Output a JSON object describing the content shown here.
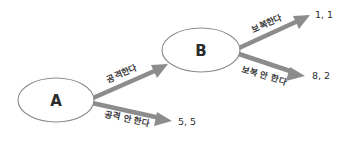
{
  "diagram": {
    "title": "",
    "background_color": "#ffffff",
    "line_color": "#8c8c8c",
    "node_stroke_color": "#8a8a8a",
    "text_color": "#2b2b2b",
    "nodes": [
      {
        "id": "A",
        "label": "A",
        "cx": 56,
        "cy": 100,
        "rx": 38,
        "ry": 22
      },
      {
        "id": "B",
        "label": "B",
        "cx": 201,
        "cy": 50,
        "rx": 39,
        "ry": 22
      }
    ],
    "edges": [
      {
        "id": "a-attack",
        "label": "공격한다",
        "from": "A",
        "to": "B",
        "x1": 93,
        "y1": 98,
        "x2": 166,
        "y2": 66,
        "label_x": 122,
        "label_y": 74,
        "label_rotate": -23
      },
      {
        "id": "a-no-attack",
        "label": "공격 안 한다",
        "from": "A",
        "to": "payoff-5-5",
        "x1": 92,
        "y1": 104,
        "x2": 170,
        "y2": 121,
        "label_x": 127,
        "label_y": 119,
        "label_rotate": 12
      },
      {
        "id": "b-retaliate",
        "label": "보복한다",
        "from": "B",
        "to": "payoff-1-1",
        "x1": 239,
        "y1": 48,
        "x2": 308,
        "y2": 16,
        "label_x": 267,
        "label_y": 24,
        "label_rotate": -23
      },
      {
        "id": "b-no-retaliate",
        "label": "보복 안 한다",
        "from": "B",
        "to": "payoff-8-2",
        "x1": 239,
        "y1": 54,
        "x2": 303,
        "y2": 76,
        "label_x": 264,
        "label_y": 76,
        "label_rotate": 17
      }
    ],
    "payoffs": [
      {
        "id": "payoff-1-1",
        "text": "1, 1",
        "x": 315,
        "y": 15
      },
      {
        "id": "payoff-8-2",
        "text": "8, 2",
        "x": 312,
        "y": 76
      },
      {
        "id": "payoff-5-5",
        "text": "5, 5",
        "x": 178,
        "y": 122
      }
    ]
  }
}
